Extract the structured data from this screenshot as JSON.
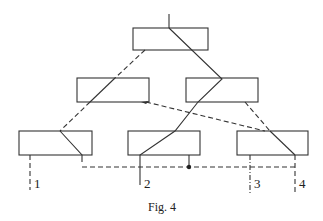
{
  "figure": {
    "caption": "Fig. 4",
    "outputs": [
      {
        "id": "1",
        "label": "1",
        "style": "dashed"
      },
      {
        "id": "2",
        "label": "2",
        "style": "solid"
      },
      {
        "id": "3",
        "label": "3",
        "style": "dash-dot"
      },
      {
        "id": "4",
        "label": "4",
        "style": "dashed"
      }
    ],
    "boxes": [
      {
        "id": "top",
        "level": 0
      },
      {
        "id": "mid-left",
        "level": 1
      },
      {
        "id": "mid-right",
        "level": 1
      },
      {
        "id": "bottom-left",
        "level": 2
      },
      {
        "id": "bottom-middle",
        "level": 2
      },
      {
        "id": "bottom-right",
        "level": 2
      }
    ]
  }
}
